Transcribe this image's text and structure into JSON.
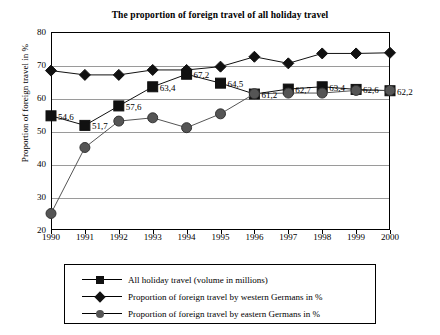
{
  "chart_data": {
    "type": "line",
    "title": "The proportion of foreign travel of all holiday travel",
    "xlabel": "",
    "ylabel": "Proportion of foreign travel in %",
    "categories": [
      "1990",
      "1991",
      "1992",
      "1993",
      "1994",
      "1995",
      "1996",
      "1997",
      "1998",
      "1999",
      "2000"
    ],
    "ylim": [
      20,
      80
    ],
    "yticks": [
      20,
      30,
      40,
      50,
      60,
      70,
      80
    ],
    "grid": true,
    "legend_position": "bottom",
    "series": [
      {
        "name": "All holiday travel (volume in millions)",
        "marker": "square",
        "color": "#111111",
        "values": [
          54.6,
          51.7,
          57.6,
          63.4,
          67.2,
          64.5,
          61.2,
          62.7,
          63.4,
          62.6,
          62.2
        ],
        "labels": [
          "54,6",
          "51,7",
          "57,6",
          "63,4",
          "67,2",
          "64,5",
          "61,2",
          "62,7",
          "63,4",
          "62,6",
          "62,2"
        ]
      },
      {
        "name": "Proportion of foreign travel by western Germans in %",
        "marker": "diamond",
        "color": "#111111",
        "values": [
          68.3,
          67.0,
          67.0,
          68.5,
          68.5,
          69.5,
          72.5,
          70.5,
          73.5,
          73.5,
          73.7
        ]
      },
      {
        "name": "Proportion of foreign travel by eastern Germans in %",
        "marker": "circle",
        "color": "#555555",
        "values": [
          25.0,
          45.0,
          53.0,
          54.0,
          51.0,
          55.2,
          61.3,
          61.5,
          61.5,
          62.3,
          62.3
        ]
      }
    ]
  }
}
